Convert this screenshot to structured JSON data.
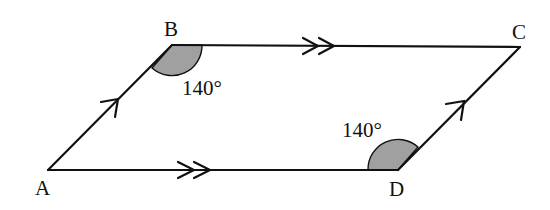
{
  "diagram": {
    "type": "parallelogram",
    "vertices": [
      {
        "label": "A",
        "x": 48,
        "y": 170
      },
      {
        "label": "B",
        "x": 172,
        "y": 45
      },
      {
        "label": "C",
        "x": 520,
        "y": 47
      },
      {
        "label": "D",
        "x": 398,
        "y": 170
      }
    ],
    "angles": [
      {
        "vertex": "B",
        "value": "140°"
      },
      {
        "vertex": "D",
        "value": "140°"
      }
    ],
    "parallel_marks": [
      {
        "sides": [
          "AB",
          "DC"
        ],
        "mark": "single-arrow"
      },
      {
        "sides": [
          "BC",
          "AD"
        ],
        "mark": "double-arrow"
      }
    ],
    "colors": {
      "stroke": "#111111",
      "angle_fill": "#a0a0a0",
      "background": "#ffffff"
    }
  }
}
